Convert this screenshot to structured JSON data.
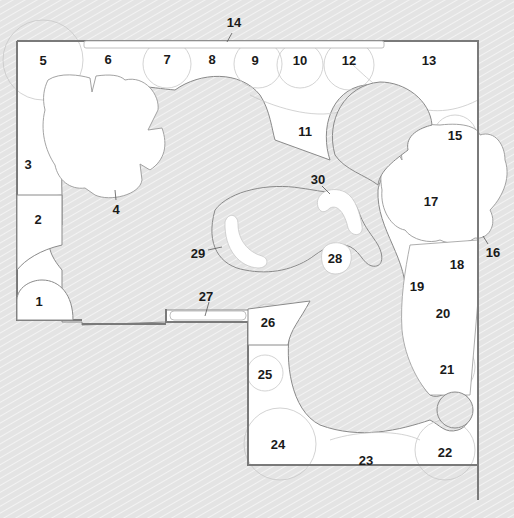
{
  "diagram": {
    "type": "garden-planting-plan",
    "colors": {
      "background_hatch": "#e3e3e3",
      "bed_fill": "#ffffff",
      "wall_line": "#7a7a7a",
      "plant_outline": "#c8c8c8",
      "lawn_outline": "#8a8a8a",
      "label": "#1a1a1a"
    },
    "labels": [
      {
        "id": "1",
        "text": "1",
        "x": 39,
        "y": 301
      },
      {
        "id": "2",
        "text": "2",
        "x": 38,
        "y": 219
      },
      {
        "id": "3",
        "text": "3",
        "x": 28,
        "y": 164
      },
      {
        "id": "4",
        "text": "4",
        "x": 116,
        "y": 209
      },
      {
        "id": "5",
        "text": "5",
        "x": 43,
        "y": 60
      },
      {
        "id": "6",
        "text": "6",
        "x": 108,
        "y": 59
      },
      {
        "id": "7",
        "text": "7",
        "x": 167,
        "y": 59
      },
      {
        "id": "8",
        "text": "8",
        "x": 212,
        "y": 59
      },
      {
        "id": "9",
        "text": "9",
        "x": 255,
        "y": 60
      },
      {
        "id": "10",
        "text": "10",
        "x": 300,
        "y": 60
      },
      {
        "id": "11",
        "text": "11",
        "x": 305,
        "y": 131
      },
      {
        "id": "12",
        "text": "12",
        "x": 349,
        "y": 60
      },
      {
        "id": "13",
        "text": "13",
        "x": 429,
        "y": 60
      },
      {
        "id": "14",
        "text": "14",
        "x": 234,
        "y": 22
      },
      {
        "id": "15",
        "text": "15",
        "x": 455,
        "y": 135
      },
      {
        "id": "16",
        "text": "16",
        "x": 493,
        "y": 252
      },
      {
        "id": "17",
        "text": "17",
        "x": 431,
        "y": 201
      },
      {
        "id": "18",
        "text": "18",
        "x": 457,
        "y": 264
      },
      {
        "id": "19",
        "text": "19",
        "x": 417,
        "y": 286
      },
      {
        "id": "20",
        "text": "20",
        "x": 443,
        "y": 313
      },
      {
        "id": "21",
        "text": "21",
        "x": 447,
        "y": 369
      },
      {
        "id": "22",
        "text": "22",
        "x": 445,
        "y": 452
      },
      {
        "id": "23",
        "text": "23",
        "x": 366,
        "y": 460
      },
      {
        "id": "24",
        "text": "24",
        "x": 278,
        "y": 444
      },
      {
        "id": "25",
        "text": "25",
        "x": 265,
        "y": 374
      },
      {
        "id": "26",
        "text": "26",
        "x": 268,
        "y": 322
      },
      {
        "id": "27",
        "text": "27",
        "x": 206,
        "y": 296
      },
      {
        "id": "28",
        "text": "28",
        "x": 335,
        "y": 258
      },
      {
        "id": "29",
        "text": "29",
        "x": 198,
        "y": 253
      },
      {
        "id": "30",
        "text": "30",
        "x": 318,
        "y": 179
      }
    ]
  }
}
